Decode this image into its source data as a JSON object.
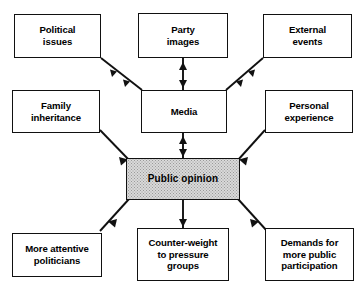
{
  "diagram": {
    "theme": {
      "line_color": "#111111",
      "box_fill": "#ffffff",
      "center_fill": "#d9d9d9",
      "text_color": "#000000"
    },
    "nodes": [
      {
        "id": "political-issues",
        "label": "Political\nissues",
        "lines": [
          "Political",
          "issues"
        ],
        "x": 14,
        "y": 14,
        "w": 87,
        "h": 44
      },
      {
        "id": "party-images",
        "label": "Party\nimages",
        "lines": [
          "Party",
          "images"
        ],
        "x": 138,
        "y": 13,
        "w": 90,
        "h": 45
      },
      {
        "id": "external-events",
        "label": "External\nevents",
        "lines": [
          "External",
          "events"
        ],
        "x": 263,
        "y": 14,
        "w": 89,
        "h": 44
      },
      {
        "id": "family-inheritance",
        "label": "Family\ninheritance",
        "lines": [
          "Family",
          "inheritance"
        ],
        "x": 12,
        "y": 90,
        "w": 88,
        "h": 43
      },
      {
        "id": "media",
        "label": "Media",
        "lines": [
          "Media"
        ],
        "x": 141,
        "y": 90,
        "w": 86,
        "h": 43
      },
      {
        "id": "personal-experience",
        "label": "Personal\nexperience",
        "lines": [
          "Personal",
          "experience"
        ],
        "x": 265,
        "y": 90,
        "w": 88,
        "h": 43
      },
      {
        "id": "public-opinion",
        "label": "Public opinion",
        "lines": [
          "Public opinion"
        ],
        "x": 126,
        "y": 158,
        "w": 114,
        "h": 42,
        "center": true
      },
      {
        "id": "more-attentive",
        "label": "More attentive\npoliticians",
        "lines": [
          "More attentive",
          "politicians"
        ],
        "x": 12,
        "y": 233,
        "w": 90,
        "h": 44
      },
      {
        "id": "counter-weight",
        "label": "Counter-weight\nto pressure\ngroups",
        "lines": [
          "Counter-weight",
          "to pressure",
          "groups"
        ],
        "x": 137,
        "y": 228,
        "w": 92,
        "h": 53
      },
      {
        "id": "demands",
        "label": "Demands for\nmore public\nparticipation",
        "lines": [
          "Demands for",
          "more public",
          "participation"
        ],
        "x": 265,
        "y": 228,
        "w": 89,
        "h": 53
      }
    ],
    "edges": [
      {
        "id": "political-issues-to-media",
        "from": "political-issues",
        "to": "media",
        "style": "double-arrow-diagonal"
      },
      {
        "id": "party-images-to-media",
        "from": "party-images",
        "to": "media",
        "style": "double-arrow-vertical"
      },
      {
        "id": "external-events-to-media",
        "from": "external-events",
        "to": "media",
        "style": "double-arrow-diagonal"
      },
      {
        "id": "family-inheritance-to-public-opinion",
        "from": "family-inheritance",
        "to": "public-opinion",
        "style": "arrow"
      },
      {
        "id": "media-to-public-opinion",
        "from": "media",
        "to": "public-opinion",
        "style": "double-arrow-vertical"
      },
      {
        "id": "personal-experience-to-public-opinion",
        "from": "personal-experience",
        "to": "public-opinion",
        "style": "arrow"
      },
      {
        "id": "public-opinion-to-more-attentive",
        "from": "public-opinion",
        "to": "more-attentive",
        "style": "arrow"
      },
      {
        "id": "public-opinion-to-counter-weight",
        "from": "public-opinion",
        "to": "counter-weight",
        "style": "arrow"
      },
      {
        "id": "public-opinion-to-demands",
        "from": "public-opinion",
        "to": "demands",
        "style": "arrow"
      }
    ]
  }
}
